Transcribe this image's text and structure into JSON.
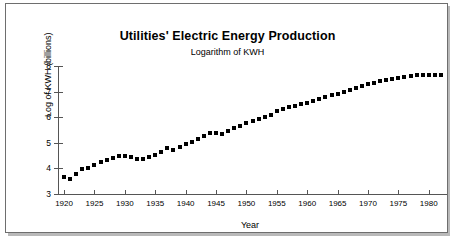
{
  "figure": {
    "title": "Utilities' Electric Energy Production",
    "subtitle": "Logarithm of KWH"
  },
  "chart_data": {
    "type": "scatter",
    "title": "Utilities' Electric Energy Production",
    "subtitle": "Logarithm of KWH",
    "xlabel": "Year",
    "ylabel": "Log of KWH (billions)",
    "xlim": [
      1919,
      1983
    ],
    "ylim": [
      3,
      8
    ],
    "xticks": [
      1920,
      1925,
      1930,
      1935,
      1940,
      1945,
      1950,
      1955,
      1960,
      1965,
      1970,
      1975,
      1980
    ],
    "xticklabels": [
      "1920",
      "1925",
      "1930",
      "1935",
      "1940",
      "1945",
      "1950",
      "1955",
      "1960",
      "1965",
      "1970",
      "1975",
      "1980"
    ],
    "yticks": [
      3,
      4,
      5,
      6,
      7,
      8
    ],
    "yticklabels": [
      "3",
      "4",
      "5",
      "6",
      "7",
      "8"
    ],
    "grid": false,
    "legend": false,
    "marker": "square",
    "marker_color": "#000000",
    "series": [
      {
        "name": "Log of KWH (billions)",
        "x": [
          1920,
          1921,
          1922,
          1923,
          1924,
          1925,
          1926,
          1927,
          1928,
          1929,
          1930,
          1931,
          1932,
          1933,
          1934,
          1935,
          1936,
          1937,
          1938,
          1939,
          1940,
          1941,
          1942,
          1943,
          1944,
          1945,
          1946,
          1947,
          1948,
          1949,
          1950,
          1951,
          1952,
          1953,
          1954,
          1955,
          1956,
          1957,
          1958,
          1959,
          1960,
          1961,
          1962,
          1963,
          1964,
          1965,
          1966,
          1967,
          1968,
          1969,
          1970,
          1971,
          1972,
          1973,
          1974,
          1975,
          1976,
          1977,
          1978,
          1979,
          1980,
          1981,
          1982
        ],
        "y": [
          3.67,
          3.6,
          3.77,
          3.96,
          4.02,
          4.13,
          4.26,
          4.32,
          4.41,
          4.5,
          4.48,
          4.43,
          4.35,
          4.37,
          4.44,
          4.52,
          4.65,
          4.78,
          4.72,
          4.85,
          4.96,
          5.04,
          5.13,
          5.28,
          5.4,
          5.39,
          5.36,
          5.46,
          5.57,
          5.64,
          5.77,
          5.86,
          5.93,
          6.02,
          6.08,
          6.23,
          6.33,
          6.38,
          6.42,
          6.5,
          6.57,
          6.63,
          6.7,
          6.78,
          6.86,
          6.92,
          6.99,
          7.05,
          7.13,
          7.22,
          7.29,
          7.35,
          7.41,
          7.46,
          7.48,
          7.52,
          7.57,
          7.61,
          7.63,
          7.65,
          7.65,
          7.64,
          7.66
        ]
      }
    ]
  }
}
